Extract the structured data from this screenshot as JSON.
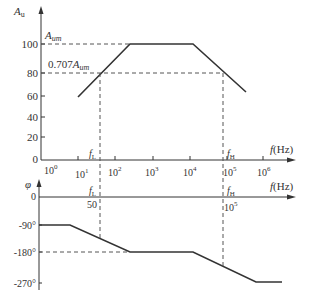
{
  "magnitude_plot": {
    "y_axis_label": "A",
    "y_axis_sub": "u",
    "y_ticks": [
      "100",
      "80",
      "60",
      "40",
      "20",
      "0"
    ],
    "aum_label": "A",
    "aum_sub": "um",
    "aum_707_prefix": "0.707",
    "aum_707_label": "A",
    "aum_707_sub": "um",
    "x_ticks": [
      {
        "base": "10",
        "exp": "0"
      },
      {
        "base": "10",
        "exp": "1"
      },
      {
        "base": "10",
        "exp": "2"
      },
      {
        "base": "10",
        "exp": "3"
      },
      {
        "base": "10",
        "exp": "4"
      },
      {
        "base": "10",
        "exp": "5"
      },
      {
        "base": "10",
        "exp": "6"
      }
    ],
    "fL_label": "f",
    "fL_sub": "L",
    "fH_label": "f",
    "fH_sub": "H",
    "x_axis_label": "f",
    "x_axis_unit": "(Hz)"
  },
  "phase_plot": {
    "y_axis_label": "φ",
    "y_ticks": [
      "0",
      "-90°",
      "-180°",
      "-270°"
    ],
    "fL_label": "f",
    "fL_sub": "L",
    "fL_value": "50",
    "fH_label": "f",
    "fH_sub": "H",
    "fH_value_base": "10",
    "fH_value_exp": "5",
    "x_axis_label": "f",
    "x_axis_unit": "(Hz)"
  },
  "colors": {
    "line": "#333333",
    "dashed": "#555555"
  }
}
